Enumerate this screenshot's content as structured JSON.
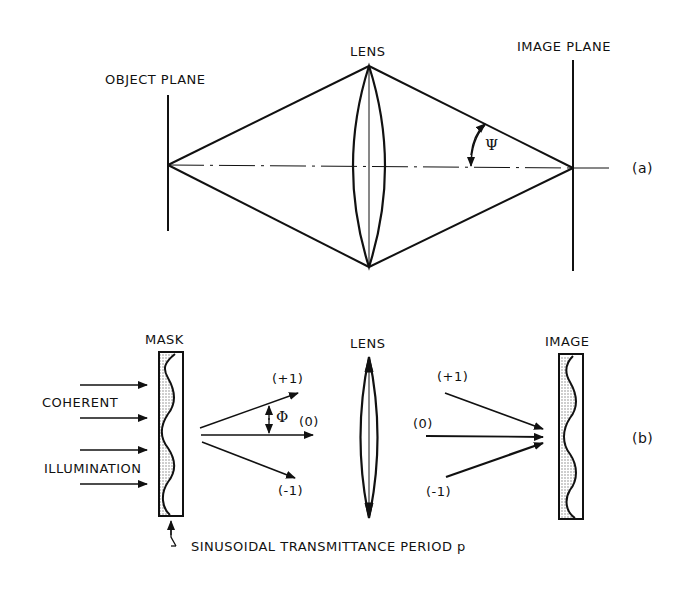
{
  "figure": {
    "panel_a": {
      "id_label": "(a)",
      "object_plane_label": "OBJECT PLANE",
      "lens_label": "LENS",
      "image_plane_label": "IMAGE PLANE",
      "angle_symbol": "Ψ"
    },
    "panel_b": {
      "id_label": "(b)",
      "mask_label": "MASK",
      "lens_label": "LENS",
      "image_label": "IMAGE",
      "illumination_label_1": "COHERENT",
      "illumination_label_2": "ILLUMINATION",
      "angle_symbol": "Φ",
      "orders_left": {
        "plus": "(+1)",
        "zero": "(0)",
        "minus": "(-1)"
      },
      "orders_right": {
        "plus": "(+1)",
        "zero": "(0)",
        "minus": "(-1)"
      },
      "caption": "SINUSOIDAL TRANSMITTANCE PERIOD p"
    }
  },
  "colors": {
    "ink": "#111111",
    "background": "#ffffff",
    "stipple": "#bbbbbb"
  }
}
